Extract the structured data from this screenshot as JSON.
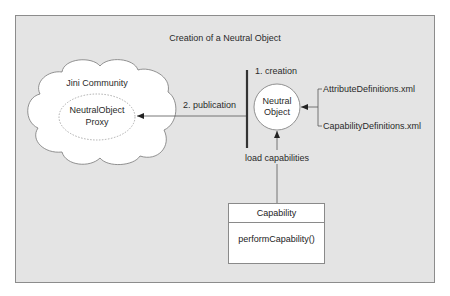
{
  "diagram": {
    "title": "Creation of a Neutral Object",
    "colors": {
      "background": "#e4e4e4",
      "frame_border": "#8c8c8c",
      "shape_fill": "#ffffff",
      "line": "#555555",
      "bar": "#333333"
    },
    "cloud": {
      "label": "Jini Community",
      "proxy_line1": "NeutralObject",
      "proxy_line2": "Proxy"
    },
    "neutral_object": {
      "line1": "Neutral",
      "line2": "Object"
    },
    "steps": {
      "creation": "1. creation",
      "publication": "2. publication",
      "load": "load capabilities"
    },
    "files": [
      "AttributeDefinitions.xml",
      "CapabilityDefinitions.xml"
    ],
    "capability_class": {
      "name": "Capability",
      "method": "performCapability()"
    }
  }
}
